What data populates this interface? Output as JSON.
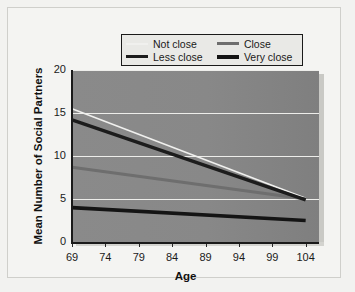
{
  "chart_data": {
    "type": "line",
    "title": "",
    "xlabel": "Age",
    "ylabel": "Mean Number of Social Partners",
    "xlim": [
      69,
      106
    ],
    "ylim": [
      0,
      20
    ],
    "xticks": [
      69,
      74,
      79,
      84,
      89,
      94,
      99,
      104
    ],
    "yticks": [
      0,
      5,
      10,
      15,
      20
    ],
    "grid": true,
    "legend_position": "top-center",
    "x": [
      69,
      104
    ],
    "series": [
      {
        "name": "Not close",
        "values": [
          15.5,
          5.1
        ],
        "color": "#f0f0ee",
        "width": 1.6
      },
      {
        "name": "Close",
        "values": [
          8.7,
          5.0
        ],
        "color": "#6e6e6e",
        "width": 3.0
      },
      {
        "name": "Less close",
        "values": [
          14.2,
          4.9
        ],
        "color": "#1c1c1c",
        "width": 3.4
      },
      {
        "name": "Very close",
        "values": [
          4.0,
          2.5
        ],
        "color": "#141414",
        "width": 3.6
      }
    ]
  },
  "legend": {
    "items": [
      {
        "label": "Not close"
      },
      {
        "label": "Close"
      },
      {
        "label": "Less close"
      },
      {
        "label": "Very close"
      }
    ]
  },
  "axes": {
    "x_title": "Age",
    "y_title": "Mean Number of Social Partners",
    "x_tick_labels": [
      "69",
      "74",
      "79",
      "84",
      "89",
      "94",
      "99",
      "104"
    ],
    "y_tick_labels": [
      "0",
      "5",
      "10",
      "15",
      "20"
    ]
  }
}
